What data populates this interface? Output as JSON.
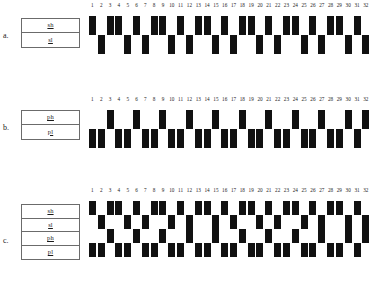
{
  "figure": {
    "tick_labels": [
      "1",
      "2",
      "3",
      "4",
      "5",
      "6",
      "7",
      "8",
      "9",
      "10",
      "11",
      "12",
      "13",
      "14",
      "15",
      "16",
      "17",
      "18",
      "19",
      "20",
      "21",
      "22",
      "23",
      "24",
      "25",
      "26",
      "27",
      "28",
      "29",
      "30",
      "31",
      "32"
    ],
    "n_columns": 32,
    "mark_color": "#111111",
    "box_border_color": "#6b6b6b"
  },
  "panels": [
    {
      "letter": "a.",
      "name": "panel-a",
      "row_labels": [
        "sh",
        "sl"
      ],
      "n_rows": 2,
      "pattern": [
        0,
        1,
        0,
        0,
        1,
        0,
        1,
        0,
        0,
        1,
        0,
        1,
        0,
        0,
        1,
        0,
        1,
        0,
        0,
        1,
        0,
        1,
        0,
        0,
        1,
        0,
        1,
        0,
        0,
        1,
        0,
        1
      ]
    },
    {
      "letter": "b.",
      "name": "panel-b",
      "row_labels": [
        "ph",
        "pl"
      ],
      "n_rows": 2,
      "pattern": [
        1,
        1,
        0,
        1,
        1,
        0,
        1,
        1,
        0,
        1,
        1,
        0,
        1,
        1,
        0,
        1,
        1,
        0,
        1,
        1,
        0,
        1,
        1,
        0,
        1,
        1,
        0,
        1,
        1,
        0,
        1,
        0
      ]
    },
    {
      "letter": "c.",
      "name": "panel-c",
      "row_labels": [
        "sh",
        "sl",
        "ph",
        "pl"
      ],
      "n_rows": 4,
      "pattern_s": [
        0,
        1,
        0,
        0,
        1,
        0,
        1,
        0,
        0,
        1,
        0,
        1,
        0,
        0,
        1,
        0,
        1,
        0,
        0,
        1,
        0,
        1,
        0,
        0,
        1,
        0,
        1,
        0,
        0,
        1,
        0,
        1
      ],
      "pattern_p": [
        1,
        1,
        0,
        1,
        1,
        0,
        1,
        1,
        0,
        1,
        1,
        0,
        1,
        1,
        0,
        1,
        1,
        0,
        1,
        1,
        0,
        1,
        1,
        0,
        1,
        1,
        0,
        1,
        1,
        0,
        1,
        0
      ]
    }
  ],
  "chart_data": {
    "type": "heatmap",
    "title": "",
    "xlabel": "",
    "ylabel": "",
    "categories": [
      "1",
      "2",
      "3",
      "4",
      "5",
      "6",
      "7",
      "8",
      "9",
      "10",
      "11",
      "12",
      "13",
      "14",
      "15",
      "16",
      "17",
      "18",
      "19",
      "20",
      "21",
      "22",
      "23",
      "24",
      "25",
      "26",
      "27",
      "28",
      "29",
      "30",
      "31",
      "32"
    ],
    "series": [
      {
        "name": "a: sh/sl",
        "rows": [
          "sh",
          "sl"
        ],
        "values": [
          0,
          1,
          0,
          0,
          1,
          0,
          1,
          0,
          0,
          1,
          0,
          1,
          0,
          0,
          1,
          0,
          1,
          0,
          0,
          1,
          0,
          1,
          0,
          0,
          1,
          0,
          1,
          0,
          0,
          1,
          0,
          1
        ]
      },
      {
        "name": "b: ph/pl",
        "rows": [
          "ph",
          "pl"
        ],
        "values": [
          1,
          1,
          0,
          1,
          1,
          0,
          1,
          1,
          0,
          1,
          1,
          0,
          1,
          1,
          0,
          1,
          1,
          0,
          1,
          1,
          0,
          1,
          1,
          0,
          1,
          1,
          0,
          1,
          1,
          0,
          1,
          0
        ]
      },
      {
        "name": "c: sh/sl/ph/pl",
        "rows": [
          "sh",
          "sl",
          "ph",
          "pl"
        ],
        "values_s": [
          0,
          1,
          0,
          0,
          1,
          0,
          1,
          0,
          0,
          1,
          0,
          1,
          0,
          0,
          1,
          0,
          1,
          0,
          0,
          1,
          0,
          1,
          0,
          0,
          1,
          0,
          1,
          0,
          0,
          1,
          0,
          1
        ],
        "values_p": [
          1,
          1,
          0,
          1,
          1,
          0,
          1,
          1,
          0,
          1,
          1,
          0,
          1,
          1,
          0,
          1,
          1,
          0,
          1,
          1,
          0,
          1,
          1,
          0,
          1,
          1,
          0,
          1,
          1,
          0,
          1,
          0
        ]
      }
    ],
    "grid": false,
    "legend": "row-labels-left"
  }
}
